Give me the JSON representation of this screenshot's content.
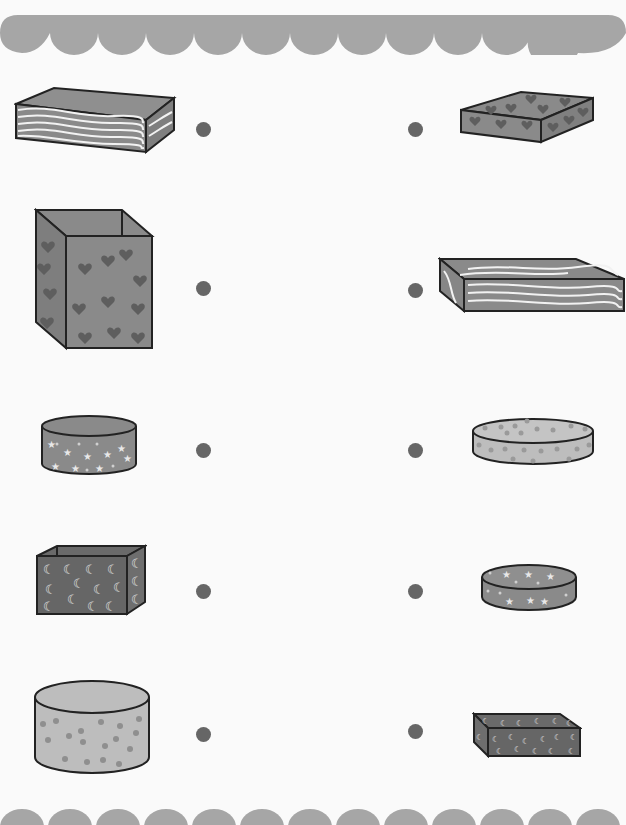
{
  "worksheet": {
    "title": "",
    "instruction_note": "Title text is clipped at top edge and not legible",
    "colors": {
      "border": "#a6a6a6",
      "dot": "#666666",
      "shape_dark": "#666666",
      "shape_mid": "#8a8a8a",
      "shape_light": "#bdbdbd",
      "outline": "#222222"
    },
    "left_column": [
      {
        "name": "wavy-pattern-rectangular-box",
        "shape": "cuboid",
        "pattern": "waves"
      },
      {
        "name": "heart-pattern-tall-box",
        "shape": "cuboid",
        "pattern": "hearts"
      },
      {
        "name": "star-pattern-cylinder-box",
        "shape": "cylinder",
        "pattern": "stars"
      },
      {
        "name": "moon-pattern-box",
        "shape": "cuboid",
        "pattern": "moons"
      },
      {
        "name": "dot-pattern-tall-cylinder-box",
        "shape": "cylinder",
        "pattern": "dots"
      }
    ],
    "right_column": [
      {
        "name": "heart-pattern-flat-box",
        "shape": "cuboid",
        "pattern": "hearts"
      },
      {
        "name": "wavy-pattern-flat-box",
        "shape": "cuboid",
        "pattern": "waves"
      },
      {
        "name": "dot-pattern-flat-cylinder",
        "shape": "cylinder",
        "pattern": "dots"
      },
      {
        "name": "star-pattern-flat-cylinder",
        "shape": "cylinder",
        "pattern": "stars"
      },
      {
        "name": "moon-pattern-flat-box",
        "shape": "cuboid",
        "pattern": "moons"
      }
    ]
  }
}
